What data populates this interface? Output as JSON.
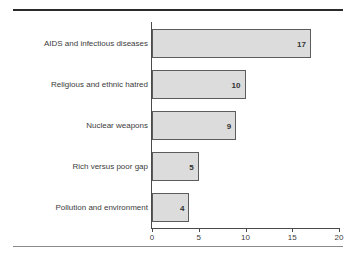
{
  "chart_data": {
    "type": "bar",
    "orientation": "horizontal",
    "title": "",
    "xlabel": "",
    "ylabel": "",
    "categories": [
      "AIDS and infectious diseases",
      "Religious and ethnic hatred",
      "Nuclear weapons",
      "Rich versus poor gap",
      "Pollution and environment"
    ],
    "values": [
      17,
      10,
      9,
      5,
      4
    ],
    "value_labels": [
      "17",
      "10",
      "9",
      "5",
      "4"
    ],
    "xlim": [
      0,
      20
    ],
    "xticks": [
      0,
      5,
      10,
      15,
      20
    ],
    "xtick_labels": [
      "0",
      "5",
      "10",
      "15",
      "20"
    ],
    "grid": false,
    "legend": false,
    "colors": {
      "bar_fill": "#dcdcdc",
      "bar_border": "#5c5c5c",
      "text": "#3c3c3c",
      "axis": "#4a4a4a",
      "rule_top": "#2b2b2b",
      "rule_bottom": "#8a8a8a",
      "background": "#ffffff"
    }
  }
}
